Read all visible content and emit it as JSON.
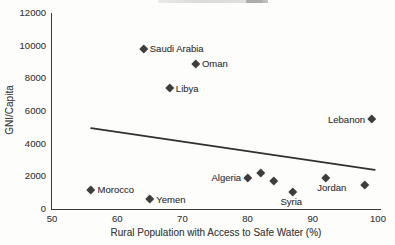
{
  "chart_data": {
    "type": "scatter",
    "title": "",
    "xlabel": "Rural Population with Access to Safe Water (%)",
    "ylabel": "GNI/Capita",
    "xlim": [
      50,
      100
    ],
    "ylim": [
      0,
      12000
    ],
    "x_ticks": [
      50,
      60,
      70,
      80,
      90,
      100
    ],
    "y_ticks": [
      0,
      2000,
      4000,
      6000,
      8000,
      10000,
      12000
    ],
    "grid": false,
    "legend": "none",
    "marker": "diamond",
    "points": [
      {
        "label": "Morocco",
        "x": 56,
        "y": 1200,
        "label_side": "right"
      },
      {
        "label": "Saudi Arabia",
        "x": 64,
        "y": 9800,
        "label_side": "right"
      },
      {
        "label": "Yemen",
        "x": 65,
        "y": 600,
        "label_side": "right"
      },
      {
        "label": "Libya",
        "x": 68,
        "y": 7400,
        "label_side": "right"
      },
      {
        "label": "Oman",
        "x": 72,
        "y": 8900,
        "label_side": "right"
      },
      {
        "label": "Algeria",
        "x": 80,
        "y": 1900,
        "label_side": "left"
      },
      {
        "label": "",
        "x": 82,
        "y": 2250,
        "label_side": "none"
      },
      {
        "label": "",
        "x": 84,
        "y": 1750,
        "label_side": "none"
      },
      {
        "label": "Syria",
        "x": 87,
        "y": 1050,
        "label_side": "below",
        "label_dx": -2
      },
      {
        "label": "Jordan",
        "x": 92,
        "y": 1900,
        "label_side": "below",
        "label_dx": 6
      },
      {
        "label": "",
        "x": 98,
        "y": 1500,
        "label_side": "none"
      },
      {
        "label": "Lebanon",
        "x": 99,
        "y": 5500,
        "label_side": "left"
      }
    ],
    "trend_line": {
      "x1": 56,
      "y1": 4950,
      "x2": 99.5,
      "y2": 2400
    }
  },
  "colors": {
    "ink": "#3d3d3d",
    "axis": "#3a3a3a",
    "trend": "#303030",
    "background": "#fdfdfc"
  }
}
